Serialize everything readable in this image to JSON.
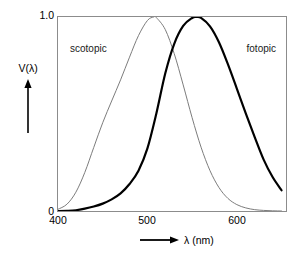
{
  "figure": {
    "background": "#ffffff",
    "frame_color": "#8c8c8c"
  },
  "axes": {
    "y_title": "V(λ)",
    "y_ticks": [
      "1.0",
      "0"
    ],
    "x_title": "λ (nm)",
    "x_ticks": [
      "400",
      "500",
      "600"
    ],
    "y_arrow_name": "up-arrow-icon",
    "x_arrow_name": "right-arrow-icon"
  },
  "labels": {
    "scotopic": "scotopic",
    "fotopic": "fotopic"
  },
  "chart_data": {
    "type": "line",
    "title": "",
    "xlabel": "λ (nm)",
    "ylabel": "V(λ)",
    "xlim": [
      400,
      655
    ],
    "ylim": [
      0,
      1.0
    ],
    "xticks": [
      400,
      500,
      600
    ],
    "yticks": [
      0,
      1.0
    ],
    "grid": false,
    "legend": "inline-annotations",
    "annotations": [
      {
        "text": "scotopic",
        "x": 432,
        "y": 0.86
      },
      {
        "text": "fotopic",
        "x": 625,
        "y": 0.86
      }
    ],
    "series": [
      {
        "name": "scotopic",
        "peak_nm": 507,
        "color": "#7a7a7a",
        "line_width": 1.0,
        "x": [
          400,
          410,
          420,
          430,
          440,
          450,
          460,
          470,
          480,
          490,
          500,
          507,
          510,
          520,
          530,
          540,
          550,
          560,
          570,
          580,
          590,
          600,
          610,
          620,
          630,
          640,
          650
        ],
        "y": [
          0.009,
          0.035,
          0.097,
          0.199,
          0.328,
          0.455,
          0.567,
          0.676,
          0.793,
          0.904,
          0.982,
          1.0,
          0.997,
          0.935,
          0.811,
          0.65,
          0.481,
          0.329,
          0.208,
          0.121,
          0.065,
          0.033,
          0.016,
          0.007,
          0.003,
          0.001,
          0.0
        ]
      },
      {
        "name": "fotopic",
        "peak_nm": 555,
        "color": "#000000",
        "line_width": 2.2,
        "x": [
          400,
          410,
          420,
          430,
          440,
          450,
          460,
          470,
          480,
          490,
          500,
          510,
          520,
          530,
          540,
          550,
          555,
          560,
          570,
          580,
          590,
          600,
          610,
          620,
          630,
          640,
          650
        ],
        "y": [
          0.0,
          0.001,
          0.004,
          0.012,
          0.023,
          0.038,
          0.06,
          0.091,
          0.139,
          0.208,
          0.323,
          0.503,
          0.71,
          0.862,
          0.954,
          0.995,
          1.0,
          0.995,
          0.952,
          0.87,
          0.757,
          0.631,
          0.503,
          0.381,
          0.265,
          0.175,
          0.107
        ]
      }
    ]
  }
}
